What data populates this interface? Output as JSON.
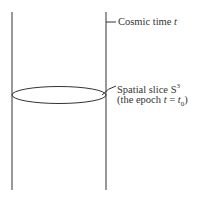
{
  "diagram": {
    "time_label": {
      "text": "Cosmic time ",
      "var": "t"
    },
    "slice_label": {
      "line1": "Spatial slice S",
      "line1_sup": "3",
      "line2_a": "(the epoch ",
      "line2_var": "t",
      "line2_eq": " = ",
      "line2_var2": "t",
      "line2_sub": "0",
      "line2_close": ")"
    },
    "colors": {
      "stroke": "#333333"
    }
  }
}
